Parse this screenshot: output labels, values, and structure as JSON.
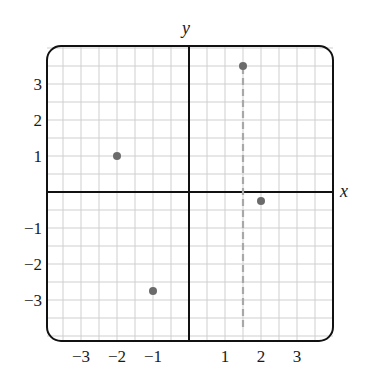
{
  "chart_data": {
    "type": "scatter",
    "title": "",
    "xlabel": "x",
    "ylabel": "y",
    "xlim": [
      -3.8,
      4.0
    ],
    "ylim": [
      -3.9,
      4.1
    ],
    "grid": true,
    "grid_step": 0.5,
    "x_ticks": [
      -3,
      -2,
      -1,
      1,
      2,
      3
    ],
    "x_tick_labels": [
      "−3",
      "−2",
      "−1",
      "1",
      "2",
      "3"
    ],
    "y_ticks": [
      3,
      2,
      1,
      -1,
      -2,
      -3
    ],
    "y_tick_labels": [
      "3",
      "2",
      "1",
      "−1",
      "−2",
      "−3"
    ],
    "extra_x_label": {
      "x": 1.5,
      "label": "1.5"
    },
    "points": [
      {
        "x": -2,
        "y": 1
      },
      {
        "x": -1,
        "y": -2.75
      },
      {
        "x": 1.5,
        "y": 3.5
      },
      {
        "x": 2,
        "y": -0.25
      }
    ],
    "annotations": [
      {
        "type": "vertical-dashed-line",
        "x": 1.5,
        "y_from": -3.75,
        "y_to": 3.5,
        "color": "#a8a8a8"
      }
    ],
    "colors": {
      "points": "#6b6b6b",
      "axes": "#111111",
      "grid": "#cfcfcf",
      "dashed_line": "#a8a8a8"
    }
  },
  "labels": {
    "x_axis": "x",
    "y_axis": "y"
  }
}
